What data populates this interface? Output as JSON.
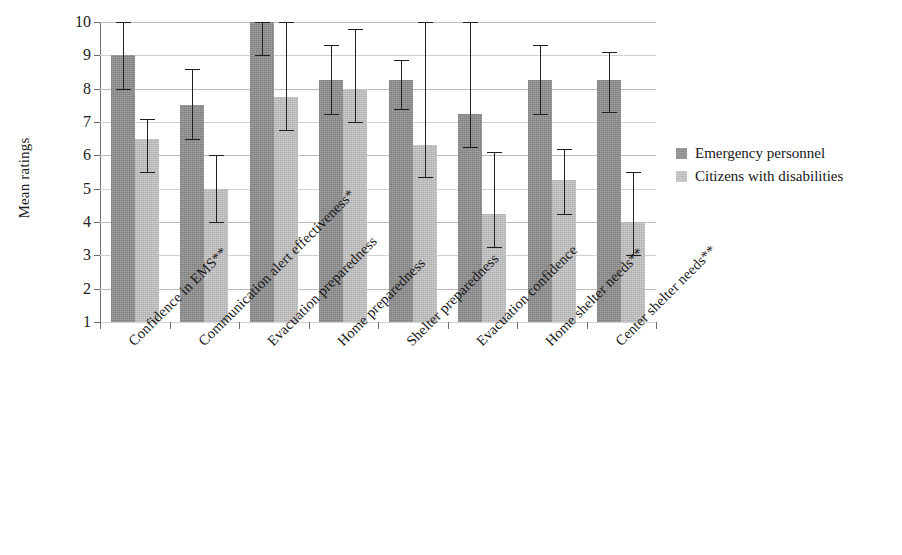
{
  "chart_data": {
    "type": "bar",
    "title": "",
    "subtitle": "",
    "xlabel": "",
    "ylabel": "Mean ratings",
    "ylim": [
      1,
      10
    ],
    "ytick_labels": [
      "1",
      "2",
      "3",
      "4",
      "5",
      "6",
      "7",
      "8",
      "9",
      "10"
    ],
    "ytick_values": [
      1,
      2,
      3,
      4,
      5,
      6,
      7,
      8,
      9,
      10
    ],
    "grid": true,
    "grid_axis": "y",
    "legend_position": "right",
    "orientation": "vertical",
    "error_bars": true,
    "categories": [
      "Confidence in EMS**",
      "Communication alert effectiveness*",
      "Evacuation preparedness",
      "Home preparedness",
      "Shelter preparedness",
      "Evacuation confidence",
      "Home shelter needs**",
      "Center shelter needs**"
    ],
    "series": [
      {
        "name": "Emergency personnel",
        "color": "#8d8d8d",
        "values": [
          9.0,
          7.5,
          10.0,
          8.25,
          8.25,
          7.25,
          8.25,
          8.25
        ],
        "err_low": [
          8.0,
          6.5,
          9.0,
          7.25,
          7.4,
          6.25,
          7.25,
          7.3
        ],
        "err_high": [
          10.0,
          8.6,
          10.0,
          9.3,
          8.85,
          10.0,
          9.3,
          9.1
        ]
      },
      {
        "name": "Citizens with disabilities",
        "color": "#bdbdbd",
        "values": [
          6.5,
          5.0,
          7.75,
          8.0,
          6.3,
          4.25,
          5.25,
          4.0
        ],
        "err_low": [
          5.5,
          4.0,
          6.75,
          7.0,
          5.35,
          3.25,
          4.25,
          3.0
        ],
        "err_high": [
          7.1,
          6.0,
          10.0,
          9.8,
          10.0,
          6.1,
          6.2,
          5.5
        ]
      }
    ]
  },
  "legend": {
    "items": [
      {
        "label": "Emergency personnel",
        "swatch": "dark"
      },
      {
        "label": "Citizens with disabilities",
        "swatch": "light"
      }
    ]
  },
  "axis": {
    "y_title": "Mean ratings"
  }
}
